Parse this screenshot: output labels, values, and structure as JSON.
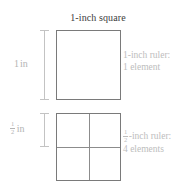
{
  "figure": {
    "title": "1-inch square",
    "background_color": "#ffffff"
  },
  "colors": {
    "title_text": "#3c3c3c",
    "square_stroke": "#7a7a7a",
    "gridline": "#8c8c8c",
    "dimension_bar": "#c3c3c3",
    "label_text": "#b4b4b4",
    "annotation_text": "#bdbdbd"
  },
  "measures": [
    {
      "id": "top",
      "value": "1",
      "unit": "in",
      "is_fraction": false,
      "numerator": "",
      "denominator": ""
    },
    {
      "id": "bottom",
      "value": "",
      "unit": "in",
      "is_fraction": true,
      "numerator": "1",
      "denominator": "2"
    }
  ],
  "annotations": [
    {
      "id": "top",
      "is_fraction": false,
      "numerator": "",
      "denominator": "",
      "line1": "1-inch ruler:",
      "line1_suffix": "",
      "line2": "1 element"
    },
    {
      "id": "bottom",
      "is_fraction": true,
      "numerator": "1",
      "denominator": "2",
      "line1": "",
      "line1_suffix": "-inch ruler:",
      "line2": "4 elements"
    }
  ],
  "chart_data": {
    "type": "diagram",
    "title": "1-inch square",
    "shapes": [
      {
        "name": "top-square",
        "side_label": "1 in",
        "rows": 1,
        "columns": 1,
        "elements": 1,
        "ruler": "1-inch ruler"
      },
      {
        "name": "bottom-square",
        "side_label": "1/2 in",
        "rows": 2,
        "columns": 2,
        "elements": 4,
        "ruler": "1/2-inch ruler"
      }
    ]
  }
}
